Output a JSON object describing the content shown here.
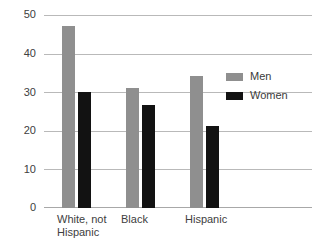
{
  "chart_data": {
    "type": "bar",
    "title": "",
    "xlabel": "",
    "ylabel": "",
    "ylim": [
      0,
      50
    ],
    "yticks": [
      0,
      10,
      20,
      30,
      40,
      50
    ],
    "grid": true,
    "legend_position": "upper-right",
    "categories": [
      "White, not\nHispanic",
      "Black",
      "Hispanic"
    ],
    "series": [
      {
        "name": "Men",
        "color": "#8f8f8f",
        "values": [
          47.5,
          31.3,
          34.5
        ]
      },
      {
        "name": "Women",
        "color": "#121212",
        "values": [
          30.3,
          26.7,
          21.3
        ]
      }
    ]
  },
  "axis": {
    "tick_labels": [
      "50",
      "40",
      "30",
      "20",
      "10",
      "0"
    ],
    "category_labels": [
      "White, not\nHispanic",
      "Black",
      "Hispanic"
    ]
  },
  "legend": {
    "items": [
      {
        "label": "Men",
        "swatch": "men-swatch"
      },
      {
        "label": "Women",
        "swatch": "women-swatch"
      }
    ]
  }
}
